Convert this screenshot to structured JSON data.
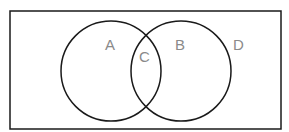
{
  "diagram": {
    "type": "venn",
    "colors": {
      "stroke": "#1a1a1a",
      "label": "#8a8a8a",
      "background": "#ffffff"
    },
    "universe": {
      "label": "D",
      "x": 10,
      "y": 11,
      "width": 271,
      "height": 118
    },
    "sets": [
      {
        "label": "A",
        "cx": 111,
        "cy": 71,
        "r": 50
      },
      {
        "label": "B",
        "cx": 181,
        "cy": 71,
        "r": 50
      }
    ],
    "intersection": {
      "label": "C"
    },
    "labels": {
      "a": "A",
      "b": "B",
      "c": "C",
      "d": "D"
    }
  }
}
